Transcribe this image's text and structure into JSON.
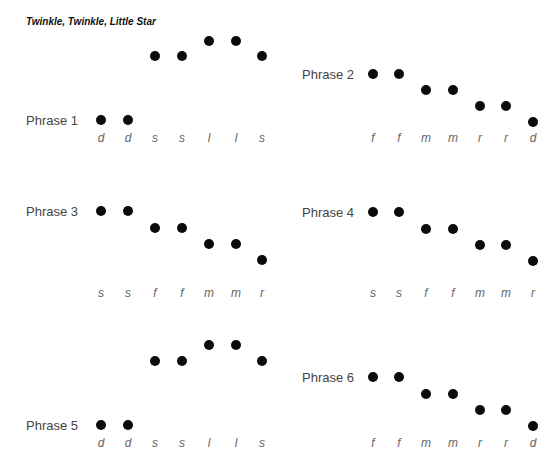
{
  "title": "Twinkle, Twinkle, Little Star",
  "phrases": [
    {
      "label": "Phrase 1",
      "label_pos": [
        26,
        113
      ],
      "x": [
        101,
        128,
        155,
        182,
        209,
        236,
        262
      ],
      "y": [
        120,
        120,
        56,
        56,
        41,
        41,
        56
      ],
      "syllables": [
        "d",
        "d",
        "s",
        "s",
        "l",
        "l",
        "s"
      ],
      "syl_y": 131
    },
    {
      "label": "Phrase 2",
      "label_pos": [
        302,
        67
      ],
      "x": [
        373,
        399,
        426,
        453,
        480,
        506,
        533
      ],
      "y": [
        74,
        74,
        90,
        90,
        106,
        106,
        122
      ],
      "syllables": [
        "f",
        "f",
        "m",
        "m",
        "r",
        "r",
        "d"
      ],
      "syl_y": 131
    },
    {
      "label": "Phrase 3",
      "label_pos": [
        26,
        204
      ],
      "x": [
        101,
        128,
        155,
        182,
        209,
        236,
        262
      ],
      "y": [
        211,
        211,
        228,
        228,
        244,
        244,
        260
      ],
      "syllables": [
        "s",
        "s",
        "f",
        "f",
        "m",
        "m",
        "r"
      ],
      "syl_y": 286
    },
    {
      "label": "Phrase 4",
      "label_pos": [
        302,
        205
      ],
      "x": [
        373,
        399,
        426,
        453,
        480,
        506,
        533
      ],
      "y": [
        212,
        212,
        229,
        229,
        245,
        245,
        261
      ],
      "syllables": [
        "s",
        "s",
        "f",
        "f",
        "m",
        "m",
        "r"
      ],
      "syl_y": 286
    },
    {
      "label": "Phrase 5",
      "label_pos": [
        26,
        418
      ],
      "x": [
        101,
        128,
        155,
        182,
        209,
        236,
        262
      ],
      "y": [
        425,
        425,
        361,
        361,
        345,
        345,
        361
      ],
      "syllables": [
        "d",
        "d",
        "s",
        "s",
        "l",
        "l",
        "s"
      ],
      "syl_y": 436
    },
    {
      "label": "Phrase 6",
      "label_pos": [
        302,
        370
      ],
      "x": [
        373,
        399,
        426,
        453,
        480,
        506,
        533
      ],
      "y": [
        377,
        377,
        394,
        394,
        410,
        410,
        426
      ],
      "syllables": [
        "f",
        "f",
        "m",
        "m",
        "r",
        "r",
        "d"
      ],
      "syl_y": 436
    }
  ]
}
